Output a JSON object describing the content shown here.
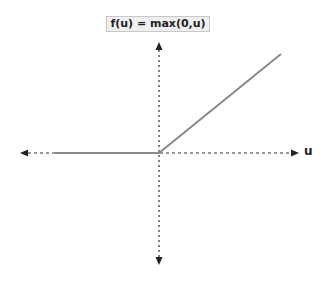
{
  "diagram": {
    "title": "f(u) = max(0,u)",
    "x_axis_label": "u",
    "function_name": "ReLU",
    "colors": {
      "axis": "#333333",
      "curve": "#8a8a8a",
      "title_bg": "#efefef",
      "title_border": "#c8c8c8"
    }
  }
}
